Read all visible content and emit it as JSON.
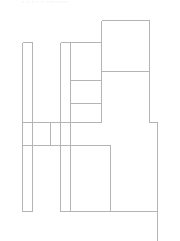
{
  "diagram": {
    "type": "floor-plan-wireframe",
    "top_text": "· · · · ·  ·········",
    "stroke_color": "#b4b4b4",
    "background": "#ffffff"
  },
  "shapes": {
    "lines": [
      {
        "x1": 101,
        "y1": 20,
        "x2": 149,
        "y2": 20
      },
      {
        "x1": 101,
        "y1": 20,
        "x2": 101,
        "y2": 122
      },
      {
        "x1": 149,
        "y1": 20,
        "x2": 149,
        "y2": 122
      },
      {
        "x1": 101,
        "y1": 71,
        "x2": 149,
        "y2": 71
      },
      {
        "x1": 149,
        "y1": 122,
        "x2": 157,
        "y2": 122
      },
      {
        "x1": 157,
        "y1": 122,
        "x2": 157,
        "y2": 241
      },
      {
        "x1": 22,
        "y1": 42,
        "x2": 32,
        "y2": 42
      },
      {
        "x1": 22,
        "y1": 42,
        "x2": 22,
        "y2": 211
      },
      {
        "x1": 32,
        "y1": 42,
        "x2": 32,
        "y2": 211
      },
      {
        "x1": 22,
        "y1": 211,
        "x2": 32,
        "y2": 211
      },
      {
        "x1": 60,
        "y1": 42,
        "x2": 101,
        "y2": 42
      },
      {
        "x1": 60,
        "y1": 42,
        "x2": 60,
        "y2": 211
      },
      {
        "x1": 70,
        "y1": 42,
        "x2": 70,
        "y2": 211
      },
      {
        "x1": 70,
        "y1": 80,
        "x2": 101,
        "y2": 80
      },
      {
        "x1": 70,
        "y1": 103,
        "x2": 101,
        "y2": 103
      },
      {
        "x1": 22,
        "y1": 122,
        "x2": 101,
        "y2": 122
      },
      {
        "x1": 50,
        "y1": 122,
        "x2": 50,
        "y2": 145
      },
      {
        "x1": 22,
        "y1": 145,
        "x2": 110,
        "y2": 145
      },
      {
        "x1": 110,
        "y1": 145,
        "x2": 110,
        "y2": 211
      },
      {
        "x1": 60,
        "y1": 211,
        "x2": 157,
        "y2": 211
      }
    ]
  }
}
